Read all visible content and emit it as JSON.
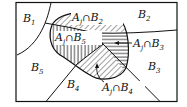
{
  "diagram": {
    "regions": [
      {
        "id": "B1",
        "label": "B",
        "sub": "1"
      },
      {
        "id": "B2",
        "label": "B",
        "sub": "2"
      },
      {
        "id": "B3",
        "label": "B",
        "sub": "3"
      },
      {
        "id": "B4",
        "label": "B",
        "sub": "4"
      },
      {
        "id": "B5",
        "label": "B",
        "sub": "5"
      }
    ],
    "intersections": [
      {
        "id": "AjB2",
        "a": "A",
        "asub": "j",
        "op": "∩",
        "b": "B",
        "bsub": "2",
        "hatch": "diagonal"
      },
      {
        "id": "AjB5",
        "a": "A",
        "asub": "j",
        "op": "∩",
        "b": "B",
        "bsub": "5",
        "hatch": "vertical"
      },
      {
        "id": "AjB3",
        "a": "A",
        "asub": "j",
        "op": "∩",
        "b": "B",
        "bsub": "3",
        "hatch": "horizontal"
      },
      {
        "id": "AjB4",
        "a": "A",
        "asub": "j",
        "op": "∩",
        "b": "B",
        "bsub": "4",
        "hatch": "diagonal"
      }
    ],
    "colors": {
      "line": "#111111",
      "background": "#ffffff"
    }
  }
}
